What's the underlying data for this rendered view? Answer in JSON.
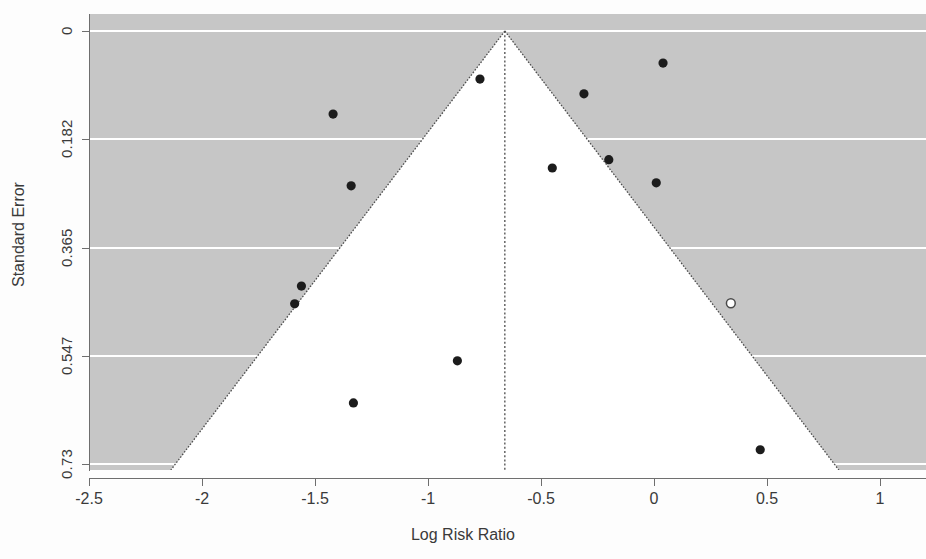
{
  "chart_data": {
    "type": "scatter",
    "title": "",
    "subtitle": "",
    "xlabel": "Log Risk Ratio",
    "ylabel": "Standard Error",
    "xlim": [
      -2.5,
      1.2
    ],
    "ylim": [
      0.76,
      0.0
    ],
    "y_axis_inverted": true,
    "xticks": [
      -2.5,
      -2,
      -1.5,
      -1,
      -0.5,
      0,
      0.5,
      1
    ],
    "xtick_labels": [
      "-2.5",
      "-2",
      "-1.5",
      "-1",
      "-0.5",
      "0",
      "0.5",
      "1"
    ],
    "yticks": [
      0,
      0.182,
      0.365,
      0.547,
      0.73
    ],
    "ytick_labels": [
      "0",
      "0.182",
      "0.365",
      "0.547",
      "0.73"
    ],
    "grid": "horizontal-white-gridlines",
    "legend": "none",
    "plot_background": "#c6c6c6",
    "funnel_fill": "#ffffff",
    "funnel_edge_color": "#555555",
    "center_line_value": -0.66,
    "center_line_style": "dotted",
    "point_color": "#1c1c1c",
    "open_point_color": "#ffffff",
    "series": [
      {
        "name": "Studies",
        "marker": "filled-circle",
        "points": [
          {
            "x": -1.42,
            "y": 0.14
          },
          {
            "x": -1.34,
            "y": 0.261
          },
          {
            "x": -1.56,
            "y": 0.43
          },
          {
            "x": -1.59,
            "y": 0.46
          },
          {
            "x": -1.33,
            "y": 0.627
          },
          {
            "x": -0.87,
            "y": 0.556
          },
          {
            "x": -0.77,
            "y": 0.081
          },
          {
            "x": -0.45,
            "y": 0.231
          },
          {
            "x": -0.31,
            "y": 0.106
          },
          {
            "x": -0.2,
            "y": 0.217
          },
          {
            "x": 0.01,
            "y": 0.256
          },
          {
            "x": 0.04,
            "y": 0.054
          },
          {
            "x": 0.47,
            "y": 0.706
          }
        ]
      },
      {
        "name": "Imputed study",
        "marker": "open-circle",
        "points": [
          {
            "x": 0.34,
            "y": 0.459
          }
        ]
      }
    ]
  },
  "axes": {
    "x_title": "Log Risk Ratio",
    "y_title": "Standard Error",
    "x_tick_labels": [
      "-2.5",
      "-2",
      "-1.5",
      "-1",
      "-0.5",
      "0",
      "0.5",
      "1"
    ],
    "y_tick_labels": [
      "0",
      "0.182",
      "0.365",
      "0.547",
      "0.73"
    ]
  }
}
